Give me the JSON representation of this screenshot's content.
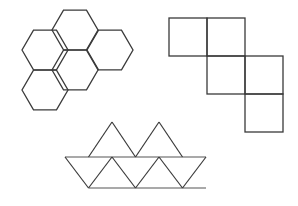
{
  "page": {
    "title": "Geometric Nets Figure",
    "background_color": "#ffffff",
    "width": 298,
    "height": 206
  },
  "style": {
    "stroke_color": "#3a3a3a",
    "stroke_color_light": "#555555",
    "stroke_width": 1.3,
    "fill": "none"
  },
  "figures": [
    {
      "id": "hexagon-cluster",
      "name": "hexagon-net",
      "description": "Cluster of five regular hexagons arranged in a flower-like pattern",
      "shape": "hexagon",
      "count": 5,
      "hex_radius": 23,
      "centers": [
        {
          "label": "top-center",
          "cx": 75,
          "cy": 30
        },
        {
          "label": "upper-left",
          "cx": 45,
          "cy": 50
        },
        {
          "label": "upper-right",
          "cx": 110,
          "cy": 50
        },
        {
          "label": "center",
          "cx": 75,
          "cy": 70
        },
        {
          "label": "lower-left",
          "cx": 45,
          "cy": 90
        }
      ]
    },
    {
      "id": "square-net",
      "name": "cube-net",
      "description": "Staircase net of six squares forming a cube net",
      "shape": "square",
      "count": 6,
      "cell_size": 38,
      "origin": {
        "x": 169,
        "y": 18
      },
      "cells": [
        {
          "label": "r0c0",
          "col": 0,
          "row": 0
        },
        {
          "label": "r0c1",
          "col": 1,
          "row": 0
        },
        {
          "label": "r1c1",
          "col": 1,
          "row": 1
        },
        {
          "label": "r1c2",
          "col": 2,
          "row": 1
        },
        {
          "label": "r2c2",
          "col": 2,
          "row": 2
        }
      ]
    },
    {
      "id": "triangle-net",
      "name": "icosahedron-strip-net",
      "description": "Strip of equilateral triangles with two additional upward triangles on top",
      "shape": "triangle",
      "count": 11,
      "side_length": 47,
      "baseline_y": 188,
      "midline_y": 157,
      "apex_y": 122,
      "left_x": 65,
      "right_x": 206
    }
  ]
}
